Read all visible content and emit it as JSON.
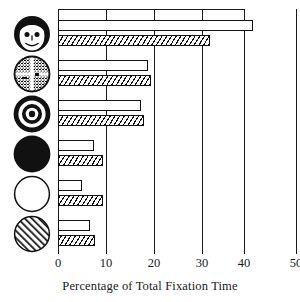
{
  "chart_data": {
    "type": "bar",
    "title": "",
    "xlabel": "Percentage of Total Fixation Time",
    "ylabel": "",
    "orientation": "horizontal",
    "xlim": [
      0,
      50
    ],
    "xticks": [
      0,
      10,
      20,
      30,
      40,
      50
    ],
    "xticklabels": [
      "0",
      "10",
      "20",
      "30",
      "40",
      "50"
    ],
    "grid": "vertical gridlines at every x tick, full plot height",
    "legend": "none (two unlabelled series per stimulus: open bar and hatched bar)",
    "categories": [
      "face-smiling-icon",
      "face-scrambled-icon",
      "bullseye-concentric-icon",
      "disc-solid-black-icon",
      "circle-blank-outline-icon",
      "circle-diagonal-hatch-icon"
    ],
    "category_descriptions": [
      "Realistic schematic face (dark hair, eyes, nose, smiling mouth)",
      "Scrambled face — circle quartered by a cross, filled with jumbled facial features",
      "Concentric bullseye — alternating black and white rings with central dot",
      "Solid black filled disc",
      "Plain unfilled circle with outline",
      "Circle filled with diagonal hatching"
    ],
    "series": [
      {
        "name": "open-bar",
        "style": "white/open outlined bar",
        "values": [
          41.0,
          19.0,
          17.5,
          7.5,
          5.0,
          6.7
        ]
      },
      {
        "name": "hatched-bar",
        "style": "diagonally hatched bar",
        "values": [
          32.0,
          19.5,
          18.0,
          9.5,
          9.5,
          7.7
        ]
      }
    ]
  },
  "axis": {
    "x_title": "Percentage of Total Fixation Time",
    "tick_labels": [
      "0",
      "10",
      "20",
      "30",
      "40",
      "50"
    ]
  },
  "icons": {
    "row_1": "face-smiling-icon",
    "row_2": "face-scrambled-icon",
    "row_3": "bullseye-concentric-icon",
    "row_4": "disc-solid-black-icon",
    "row_5": "circle-blank-outline-icon",
    "row_6": "circle-diagonal-hatch-icon"
  },
  "colors": {
    "ink": "#1a1a1a",
    "paper": "#ffffff"
  }
}
